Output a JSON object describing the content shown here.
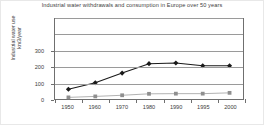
{
  "chart_data": {
    "type": "line",
    "title": "Industrial water withdrawals and consumption in Europe over 50 years",
    "xlabel": "",
    "ylabel_lines": [
      "Industrial water use",
      "km3/year"
    ],
    "ylabel": "Industrial water use km3/year",
    "categories": [
      "1950",
      "1960",
      "1970",
      "1980",
      "1990",
      "1995",
      "2000"
    ],
    "x": [
      1950,
      1960,
      1970,
      1980,
      1990,
      1995,
      2000
    ],
    "ylim": [
      0,
      500
    ],
    "yticks": [
      0,
      100,
      200,
      300
    ],
    "ytick_labels": [
      "0",
      "100",
      "200",
      "300"
    ],
    "gridlines": [
      0,
      100,
      200,
      300,
      400,
      500
    ],
    "grid": true,
    "legend": "none",
    "series": [
      {
        "name": "withdrawals",
        "marker": "diamond",
        "color": "#1a1a1a",
        "values": [
          60,
          100,
          160,
          218,
          222,
          205,
          205
        ]
      },
      {
        "name": "consumption",
        "marker": "square",
        "color": "#8f8f8f",
        "values": [
          10,
          16,
          23,
          32,
          33,
          33,
          38
        ]
      }
    ]
  },
  "colors": {
    "axis": "#6f6f6f",
    "grid": "#9a9a9a",
    "text": "#3d3d3d",
    "series_primary": "#1a1a1a",
    "series_secondary": "#8f8f8f",
    "background": "#ffffff"
  }
}
